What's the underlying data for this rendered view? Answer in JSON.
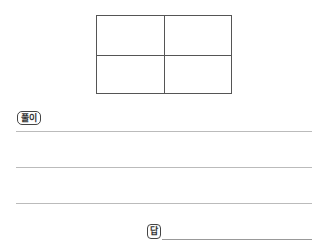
{
  "figure": {
    "type": "grid",
    "rows": 2,
    "cols": 2
  },
  "solution": {
    "label": "풀이",
    "lines": 3
  },
  "answer": {
    "label": "답",
    "value": ""
  }
}
